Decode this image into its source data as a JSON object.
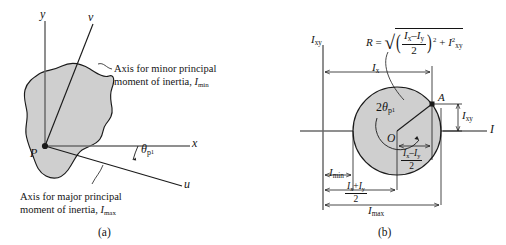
{
  "figure": {
    "panel_a": {
      "caption": "(a)",
      "point_label": "P",
      "axes": {
        "y": "y",
        "x": "x",
        "u": "u",
        "v": "v"
      },
      "angle_label": {
        "base": "θ",
        "sub": "p",
        "subsub": "1"
      },
      "note_minor": {
        "line1": "Axis for minor principal",
        "line2_pre": "moment of inertia, ",
        "line2_sym": "I",
        "line2_sub": "min"
      },
      "note_major": {
        "line1": "Axis for major principal",
        "line2_pre": "moment of inertia, ",
        "line2_sym": "I",
        "line2_sub": "max"
      }
    },
    "panel_b": {
      "caption": "(b)",
      "axis_vertical": {
        "sym": "I",
        "sub": "xy"
      },
      "axis_horizontal": {
        "sym": "I"
      },
      "center_label": "O",
      "point_label": "A",
      "angle_label": {
        "prefix": "2",
        "base": "θ",
        "sub": "p",
        "subsub": "1"
      },
      "radius_formula": {
        "lhs": "R",
        "equals": "=",
        "radical": "√",
        "num_a": "I",
        "num_a_sub": "x",
        "minus": "–",
        "num_b": "I",
        "num_b_sub": "y",
        "den": "2",
        "paren_exp": "2",
        "plus": "+",
        "term2_sym": "I",
        "term2_sup": "2",
        "term2_sub": "xy"
      },
      "dim_ix": {
        "sym": "I",
        "sub": "x"
      },
      "dim_imin": {
        "sym": "I",
        "sub": "min"
      },
      "dim_imax": {
        "sym": "I",
        "sub": "max"
      },
      "dim_ixy_right": {
        "sym": "I",
        "sub": "xy"
      },
      "dim_half_diff": {
        "num_a": "I",
        "num_a_sub": "x",
        "minus": "–",
        "num_b": "I",
        "num_b_sub": "y",
        "den": "2"
      },
      "dim_half_sum": {
        "num_a": "I",
        "num_a_sub": "x",
        "plus": "+",
        "num_b": "I",
        "num_b_sub": "y",
        "den": "2"
      }
    }
  },
  "colors": {
    "fill_gray": "#cfcfcf",
    "line": "#1a1a1a",
    "axis_gray": "#6a6a6a"
  }
}
